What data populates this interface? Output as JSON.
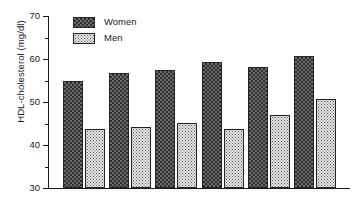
{
  "chart_data": {
    "type": "bar",
    "title": "",
    "xlabel": "",
    "ylabel": "HDL-cholesterol (mg/dl)",
    "categories": [
      "1",
      "2",
      "3",
      "4",
      "5",
      "6"
    ],
    "xtick_labels": [],
    "ytick_labels": [
      "30",
      "40",
      "50",
      "60",
      "70"
    ],
    "ytick_values": [
      30,
      40,
      50,
      60,
      70
    ],
    "yminor_values": [
      35,
      45,
      55,
      65
    ],
    "ylim": [
      30,
      70
    ],
    "grid": false,
    "legend_position": "top-left",
    "series": [
      {
        "name": "Women",
        "pattern": "dark-checkerboard",
        "color": "#4a4a4a",
        "values": [
          55.0,
          56.8,
          57.5,
          59.4,
          58.2,
          60.8
        ]
      },
      {
        "name": "Men",
        "pattern": "light-stipple",
        "color": "#e8e8e8",
        "values": [
          43.8,
          44.2,
          45.1,
          43.7,
          46.9,
          50.8
        ]
      }
    ]
  },
  "legend": {
    "items": [
      {
        "label": "Women"
      },
      {
        "label": "Men"
      }
    ]
  }
}
